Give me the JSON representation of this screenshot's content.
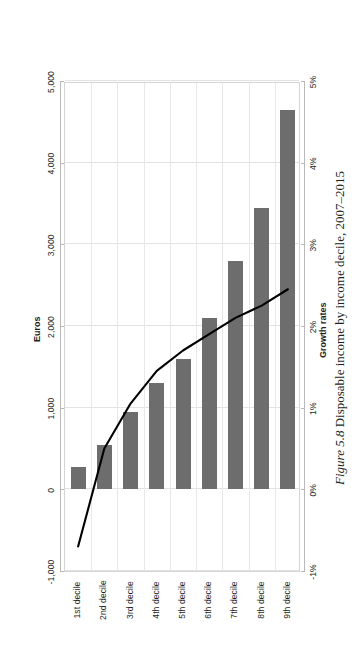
{
  "caption": {
    "label": "Figure 5.8",
    "text": "Disposable income by income decile, 2007–2015"
  },
  "chart_data": {
    "type": "bar",
    "title": "",
    "orientation": "horizontal-rotated",
    "categories": [
      "1st decile",
      "2nd decile",
      "3rd decile",
      "4th decile",
      "5th decile",
      "6th decile",
      "7th decile",
      "8th decile",
      "9th decile"
    ],
    "xlabel": "",
    "grid": true,
    "legend": "none",
    "series": [
      {
        "name": "Euros",
        "type": "bar",
        "axis": "primary",
        "axis_title": "Euros",
        "unit": "Euros",
        "color": "#6d6d6d",
        "ylim": [
          -1000,
          5000
        ],
        "ticks": [
          "-1,000",
          "0",
          "1,000",
          "2,000",
          "3,000",
          "4,000",
          "5,000"
        ],
        "tick_values": [
          -1000,
          0,
          1000,
          2000,
          3000,
          4000,
          5000
        ],
        "values": [
          270,
          540,
          950,
          1300,
          1600,
          2100,
          2800,
          3450,
          4650
        ]
      },
      {
        "name": "Growth rates",
        "type": "line",
        "axis": "secondary",
        "axis_title": "Growth rates",
        "unit": "%",
        "color": "#000000",
        "ylim": [
          -1,
          5
        ],
        "ticks": [
          "-1%",
          "0%",
          "1%",
          "2%",
          "3%",
          "4%",
          "5%"
        ],
        "tick_values": [
          -1,
          0,
          1,
          2,
          3,
          4,
          5
        ],
        "values": [
          -0.7,
          0.5,
          1.05,
          1.45,
          1.7,
          1.9,
          2.1,
          2.25,
          2.45
        ]
      }
    ]
  }
}
